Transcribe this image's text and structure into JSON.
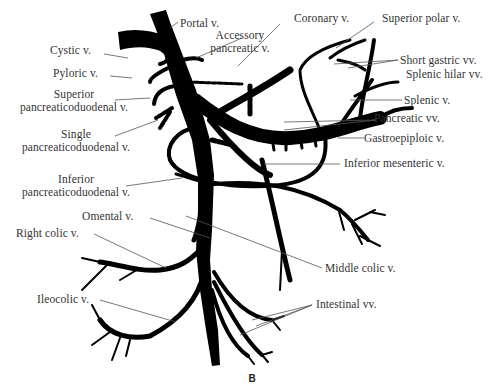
{
  "figure": {
    "panel_label": "B",
    "labels": {
      "portal": "Portal v.",
      "accessory_pancreatic_1": "Accessory",
      "accessory_pancreatic_2": "pancreatic v.",
      "coronary": "Coronary v.",
      "superior_polar": "Superior polar v.",
      "cystic": "Cystic v.",
      "pyloric": "Pyloric v.",
      "short_gastric": "Short gastric vv.",
      "splenic_hilar": "Splenic hilar vv.",
      "superior_pd_1": "Superior",
      "superior_pd_2": "pancreaticoduodenal v.",
      "splenic": "Splenic v.",
      "single_pd_1": "Single",
      "single_pd_2": "pancreaticoduodenal v.",
      "pancreatic": "Pancreatic vv.",
      "gastroepiploic": "Gastroepiploic v.",
      "inferior_mesenteric": "Inferior mesenteric v.",
      "inferior_pd_1": "Inferior",
      "inferior_pd_2": "pancreaticoduodenal v.",
      "omental": "Omental v.",
      "right_colic": "Right colic v.",
      "middle_colic": "Middle colic v.",
      "ileocolic": "Ileocolic v.",
      "intestinal": "Intestinal vv."
    }
  }
}
